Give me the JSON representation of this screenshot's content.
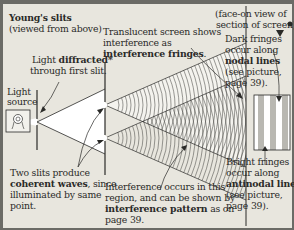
{
  "title": {
    "main": "Young's slits",
    "sub": "(viewed from above)"
  },
  "labels": {
    "light_diffracted": {
      "line1_pre": "Light ",
      "line1_bold": "diffracted*",
      "line2": "through first slit."
    },
    "light_source": {
      "line1": "Light",
      "line2": "source"
    },
    "translucent_screen": {
      "line1": "Translucent screen shows",
      "line2": "interference as",
      "line3_bold": "interference fringes",
      "line3_post": "."
    },
    "face_on_view": {
      "line1": "(face-on view of",
      "line2": "section of screen)"
    },
    "dark_fringes": {
      "line1": "Dark fringes",
      "line2": "occur along",
      "line3_bold": "nodal lines",
      "line4": "(see picture,",
      "line5": "page 39)."
    },
    "bright_fringes": {
      "line1": "Bright fringes",
      "line2": "occur along",
      "line3_bold": "antinodal lines",
      "line4": "(see picture,",
      "line5": "page 39)."
    },
    "two_slits": {
      "line1": "Two slits produce",
      "line2_bold": "coherent waves",
      "line2_post": ", since",
      "line3": "illuminated by same",
      "line4": "point."
    },
    "interference_region": {
      "line1": "Interference occurs in this",
      "line2": "region, and can be shown by",
      "line3_bold": "interference pattern",
      "line3_post": " as on",
      "line4": "page 39."
    }
  },
  "colors": {
    "paper": "#e8e6de",
    "ink": "#2a2a28",
    "border": "#6b6b66",
    "fringe_dark": "#b9b8b2",
    "fringe_light": "#ffffff"
  },
  "fringes": {
    "count_dark": 3,
    "count_bright": 4
  }
}
